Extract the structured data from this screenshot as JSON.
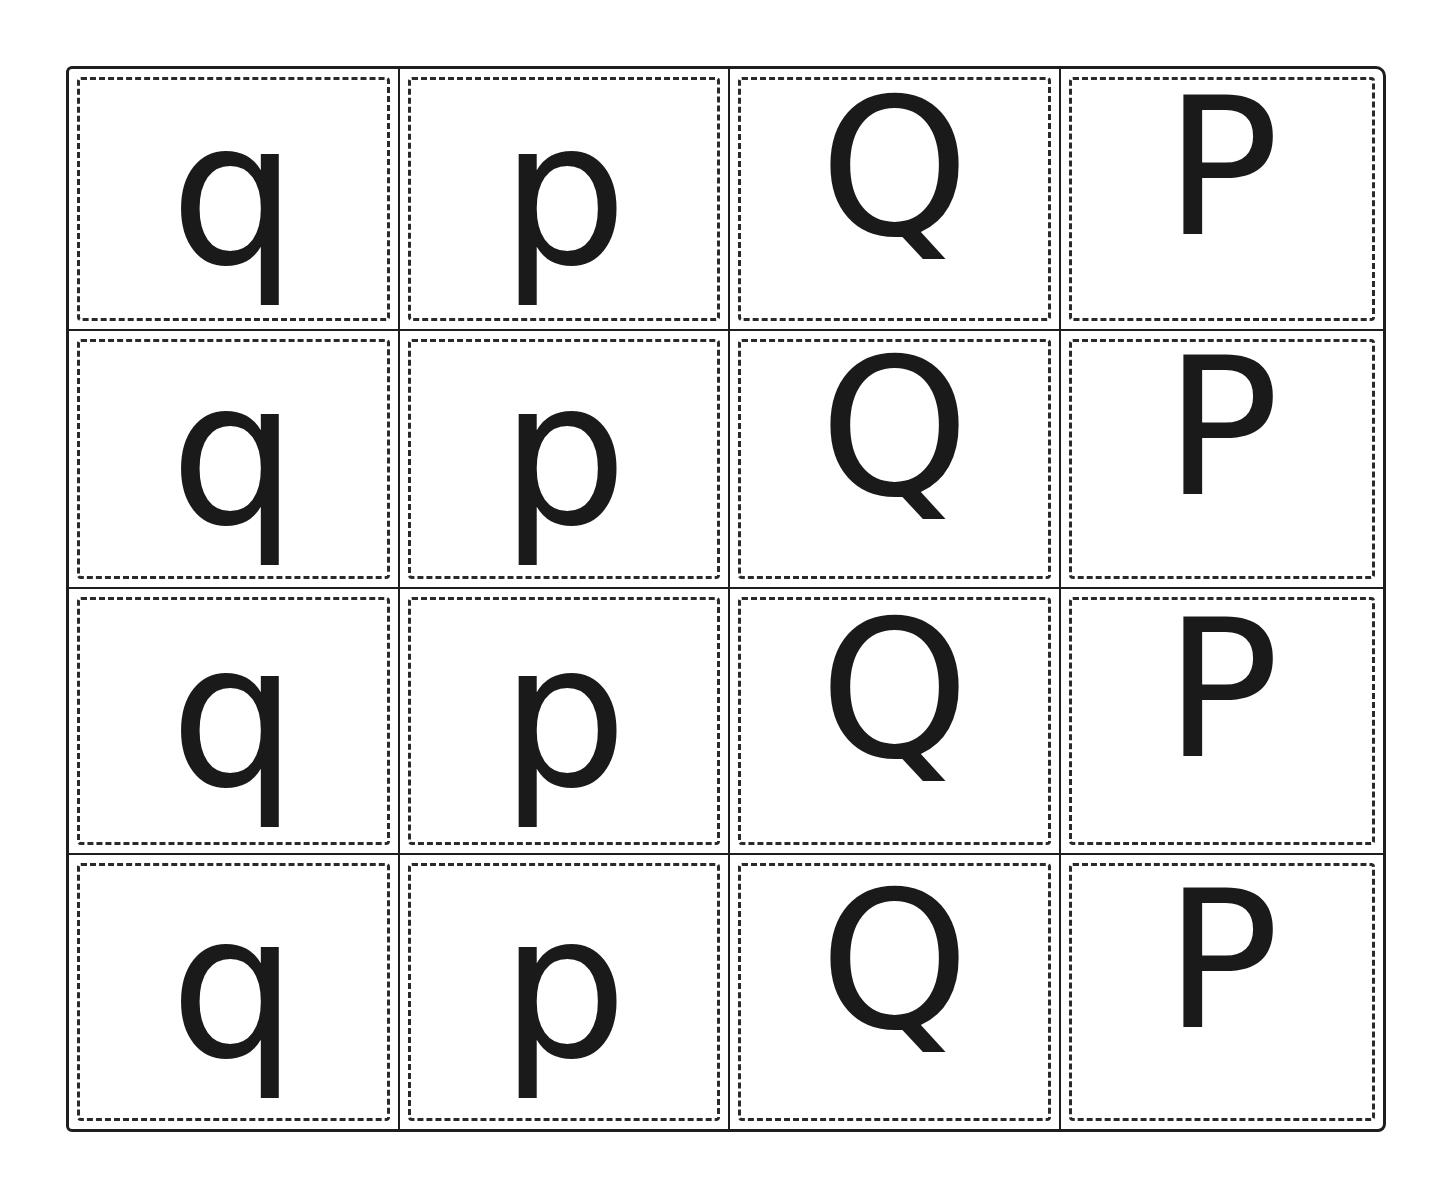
{
  "worksheet": {
    "layout": {
      "rows": 4,
      "columns": 4
    },
    "colors": {
      "ink": "#1a1a1a",
      "background": "#ffffff"
    },
    "rows": [
      {
        "cells": [
          {
            "letter": "q",
            "case": "lower"
          },
          {
            "letter": "p",
            "case": "lower"
          },
          {
            "letter": "Q",
            "case": "upper"
          },
          {
            "letter": "P",
            "case": "upper"
          }
        ]
      },
      {
        "cells": [
          {
            "letter": "q",
            "case": "lower"
          },
          {
            "letter": "p",
            "case": "lower"
          },
          {
            "letter": "Q",
            "case": "upper"
          },
          {
            "letter": "P",
            "case": "upper"
          }
        ]
      },
      {
        "cells": [
          {
            "letter": "q",
            "case": "lower"
          },
          {
            "letter": "p",
            "case": "lower"
          },
          {
            "letter": "Q",
            "case": "upper"
          },
          {
            "letter": "P",
            "case": "upper"
          }
        ]
      },
      {
        "cells": [
          {
            "letter": "q",
            "case": "lower"
          },
          {
            "letter": "p",
            "case": "lower"
          },
          {
            "letter": "Q",
            "case": "upper"
          },
          {
            "letter": "P",
            "case": "upper"
          }
        ]
      }
    ]
  }
}
